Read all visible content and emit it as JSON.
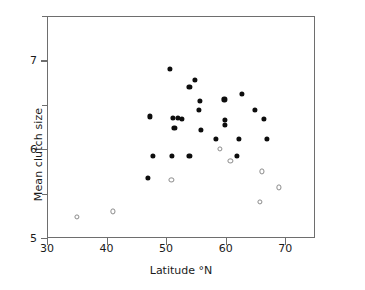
{
  "chart_data": {
    "type": "scatter",
    "title": "",
    "xlabel": "Latitude °N",
    "ylabel": "Mean clutch size",
    "xlim": [
      30,
      75
    ],
    "ylim": [
      5,
      7.5
    ],
    "xticks": [
      30,
      40,
      50,
      60,
      70
    ],
    "xtick_labels": [
      "30",
      "40",
      "50",
      "60",
      "70"
    ],
    "yticks": [
      5,
      5.5,
      6,
      6.5,
      7,
      7.5
    ],
    "ytick_labels": [
      "5",
      "",
      "6",
      "",
      "7",
      ""
    ],
    "grid": false,
    "legend": "none",
    "series": [
      {
        "name": "filled",
        "marker": "filled-circle",
        "color": "#0d0d0d",
        "points": [
          [
            50.7,
            6.9
          ],
          [
            54.9,
            6.78
          ],
          [
            53.9,
            6.7
          ],
          [
            62.7,
            6.62
          ],
          [
            59.8,
            6.56
          ],
          [
            55.7,
            6.54
          ],
          [
            55.5,
            6.44
          ],
          [
            64.9,
            6.44
          ],
          [
            47.3,
            6.37
          ],
          [
            51.1,
            6.35
          ],
          [
            52.0,
            6.35
          ],
          [
            52.6,
            6.34
          ],
          [
            66.4,
            6.34
          ],
          [
            59.9,
            6.33
          ],
          [
            59.9,
            6.27
          ],
          [
            51.4,
            6.24
          ],
          [
            55.8,
            6.22
          ],
          [
            58.4,
            6.12
          ],
          [
            62.2,
            6.12
          ],
          [
            66.9,
            6.12
          ],
          [
            47.8,
            5.92
          ],
          [
            51.0,
            5.92
          ],
          [
            53.9,
            5.92
          ],
          [
            61.9,
            5.92
          ],
          [
            47.0,
            5.68
          ]
        ]
      },
      {
        "name": "open",
        "marker": "open-circle",
        "color": "#8a8a8a",
        "points": [
          [
            59.0,
            6.0
          ],
          [
            60.8,
            5.87
          ],
          [
            50.9,
            5.65
          ],
          [
            66.1,
            5.75
          ],
          [
            68.9,
            5.57
          ],
          [
            65.7,
            5.41
          ],
          [
            35.0,
            5.24
          ],
          [
            41.0,
            5.3
          ]
        ]
      }
    ]
  }
}
